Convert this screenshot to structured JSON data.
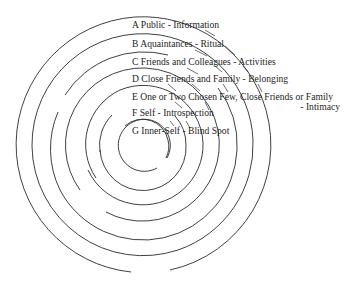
{
  "diagram": {
    "center": {
      "x": 143,
      "y": 145
    },
    "line_color": "#2a2a2a",
    "rings": [
      {
        "id": "A",
        "label": "A Public - Information",
        "radius": 128
      },
      {
        "id": "B",
        "label": "B Aquaintances - Ritual",
        "radius": 111
      },
      {
        "id": "C",
        "label": "C Friends and Colleagues - Activities",
        "radius": 94
      },
      {
        "id": "D",
        "label": "D Close Friends and Family - Belonging",
        "radius": 77
      },
      {
        "id": "E",
        "label": "E One or Two  Chosen Few, Close Friends or Family",
        "label_line2": "- Intimacy",
        "radius": 60
      },
      {
        "id": "F",
        "label": "F Self - Introspection",
        "radius": 43
      },
      {
        "id": "G",
        "label": "G Inner-Self - Blind Spot",
        "radius": 26
      }
    ]
  }
}
